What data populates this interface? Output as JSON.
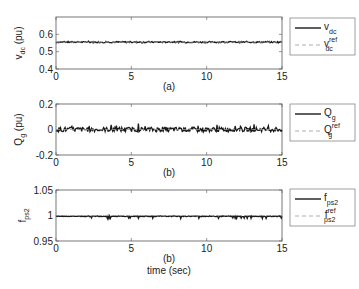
{
  "chart_data": [
    {
      "type": "line",
      "panel": "(a)",
      "title": "",
      "xlabel": "",
      "ylabel": "v_dc (pu)",
      "ylabel_main": "v",
      "ylabel_sub": "dc",
      "ylabel_unit": "(pu)",
      "xlim": [
        0,
        15
      ],
      "ylim": [
        0.4,
        0.7
      ],
      "xticks": [
        0,
        5,
        10,
        15
      ],
      "yticks": [
        0.4,
        0.5,
        0.6
      ],
      "ytick_labels": [
        "0.4",
        "0.5",
        "0.6"
      ],
      "grid": false,
      "legend_position": "outside-right",
      "series": [
        {
          "name": "v_dc",
          "label_main": "v",
          "label_sub": "dc",
          "label_sup": "",
          "style": "solid",
          "color": "#1a1a1a",
          "mean": 0.555,
          "noise": 0.004,
          "spikes": 0.006
        },
        {
          "name": "v_dc^ref",
          "label_main": "v",
          "label_sub": "dc",
          "label_sup": "ref",
          "style": "dashed",
          "color": "#9a9a9a",
          "mean": 0.555,
          "noise": 0,
          "spikes": 0
        }
      ]
    },
    {
      "type": "line",
      "panel": "(b)",
      "title": "",
      "xlabel": "",
      "ylabel": "Q_g (pu)",
      "ylabel_main": "Q",
      "ylabel_sub": "g",
      "ylabel_unit": "(pu)",
      "xlim": [
        0,
        15
      ],
      "ylim": [
        -0.2,
        0.2
      ],
      "xticks": [
        0,
        5,
        10,
        15
      ],
      "yticks": [
        -0.2,
        0,
        0.2
      ],
      "ytick_labels": [
        "-0.2",
        "0",
        "0.2"
      ],
      "grid": false,
      "legend_position": "outside-right",
      "series": [
        {
          "name": "Q_g",
          "label_main": "Q",
          "label_sub": "g",
          "label_sup": "",
          "style": "solid",
          "color": "#1a1a1a",
          "mean": 0.0,
          "noise": 0.018,
          "spikes": 0.045
        },
        {
          "name": "Q_g^ref",
          "label_main": "Q",
          "label_sub": "g",
          "label_sup": "ref",
          "style": "dashed",
          "color": "#9a9a9a",
          "mean": 0.0,
          "noise": 0,
          "spikes": 0
        }
      ]
    },
    {
      "type": "line",
      "panel": "(b)",
      "title": "",
      "xlabel": "time (sec)",
      "ylabel": "f_ps2",
      "ylabel_main": "f",
      "ylabel_sub": "ps2",
      "ylabel_unit": "",
      "xlim": [
        0,
        15
      ],
      "ylim": [
        0.95,
        1.05
      ],
      "xticks": [
        0,
        5,
        10,
        15
      ],
      "yticks": [
        0.95,
        1,
        1.05
      ],
      "ytick_labels": [
        "0.95",
        "1",
        "1.05"
      ],
      "grid": false,
      "legend_position": "outside-right",
      "series": [
        {
          "name": "f_ps2",
          "label_main": "f",
          "label_sub": "ps2",
          "label_sup": "",
          "style": "solid",
          "color": "#1a1a1a",
          "mean": 0.9985,
          "noise": 0.0008,
          "spikes": -0.004
        },
        {
          "name": "f_ps2^ref",
          "label_main": "f",
          "label_sub": "ps2",
          "label_sup": "ref",
          "style": "dashed",
          "color": "#9a9a9a",
          "mean": 1.0,
          "noise": 0,
          "spikes": 0
        }
      ]
    }
  ],
  "figure": {
    "xlabel": "time (sec)",
    "captions": [
      "(a)",
      "(b)",
      "(b)"
    ]
  }
}
